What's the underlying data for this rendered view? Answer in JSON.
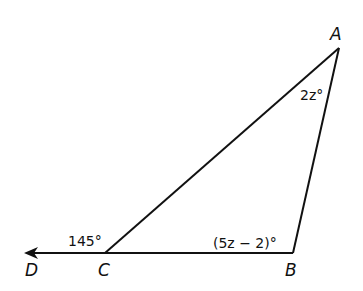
{
  "diagram": {
    "type": "triangle-exterior-angle",
    "points": {
      "A": {
        "label": "A"
      },
      "B": {
        "label": "B"
      },
      "C": {
        "label": "C"
      },
      "D": {
        "label": "D"
      }
    },
    "angles": {
      "A": "2z°",
      "B": "(5z − 2)°",
      "exterior_C": "145°"
    },
    "line_color": "#111111"
  }
}
